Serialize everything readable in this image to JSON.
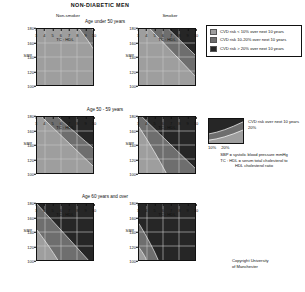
{
  "title": "NON-DIABETIC MEN",
  "columns": [
    {
      "id": "non-smoker",
      "label": "Non-smoker"
    },
    {
      "id": "smoker",
      "label": "Smoker"
    }
  ],
  "rows": [
    {
      "id": "age-under-50",
      "label": "Age under 50 years"
    },
    {
      "id": "age-50-59",
      "label": "Age 50 - 59 years"
    },
    {
      "id": "age-60-over",
      "label": "Age 60 years and over"
    }
  ],
  "axes": {
    "ylabel": "SBP",
    "xlabel": "TC : HDL",
    "yticks": [
      "180",
      "160",
      "140",
      "120",
      "100"
    ],
    "xticks": [
      "3",
      "4",
      "5",
      "6",
      "7",
      "8",
      "9",
      "10"
    ],
    "ylim": [
      100,
      180
    ],
    "xlim": [
      3,
      10
    ]
  },
  "legend": {
    "items": [
      {
        "color": "#9e9e9e",
        "label": "CVD risk < 10% over next 10 years"
      },
      {
        "color": "#6e6e6e",
        "label": "CVD risk 10-20% over next 10 years"
      },
      {
        "color": "#262626",
        "label": "CVD risk > 20% over next 10 years"
      }
    ]
  },
  "key": {
    "caption": "CVD risk over next 10 years",
    "caption_value": "20%",
    "percent_low": "10%",
    "percent_high": "20%"
  },
  "definitions": {
    "line1": "SBP = systolic blood pressure mmHg",
    "line2": "TC : HDL = serum total cholesterol to",
    "line3": "HDL cholesterol ratio"
  },
  "copyright": {
    "line1": "Copyright University",
    "line2": "of Manchester"
  },
  "colors": {
    "low": "#9e9e9e",
    "mid": "#6e6e6e",
    "high": "#262626",
    "grid": "#c9c9c9",
    "axis": "#111111"
  },
  "chart_data": {
    "type": "heatmap",
    "title": "NON-DIABETIC MEN",
    "xlabel": "TC : HDL",
    "ylabel": "SBP",
    "xlim": [
      3,
      10
    ],
    "ylim": [
      100,
      180
    ],
    "grid": true,
    "legend_position": "right",
    "zones": [
      "<10%",
      "10-20%",
      ">20%"
    ],
    "panels": [
      {
        "row": "Age under 50 years",
        "column": "Non-smoker",
        "boundary_10pct": [
          [
            8.3,
            180
          ],
          [
            10,
            152
          ]
        ],
        "boundary_20pct": [
          [
            9.9,
            180
          ],
          [
            10,
            176
          ]
        ],
        "dominant_zone": "<10%"
      },
      {
        "row": "Age under 50 years",
        "column": "Smoker",
        "boundary_10pct": [
          [
            4.4,
            180
          ],
          [
            10,
            113
          ]
        ],
        "boundary_20pct": [
          [
            6.7,
            180
          ],
          [
            10,
            143
          ]
        ],
        "dominant_zone": "10-20%"
      },
      {
        "row": "Age 50 - 59 years",
        "column": "Non-smoker",
        "boundary_10pct": [
          [
            3.6,
            180
          ],
          [
            10,
            110
          ]
        ],
        "boundary_20pct": [
          [
            5.6,
            180
          ],
          [
            10,
            136
          ]
        ],
        "dominant_zone": "10-20%"
      },
      {
        "row": "Age 50 - 59 years",
        "column": "Smoker",
        "boundary_10pct": [
          [
            3.0,
            166
          ],
          [
            6.4,
            100
          ]
        ],
        "boundary_20pct": [
          [
            3.4,
            180
          ],
          [
            10,
            107
          ]
        ],
        "dominant_zone": ">20%"
      },
      {
        "row": "Age 60 years and over",
        "column": "Non-smoker",
        "boundary_10pct": [
          [
            3.0,
            143
          ],
          [
            5.6,
            100
          ]
        ],
        "boundary_20pct": [
          [
            3.0,
            180
          ],
          [
            9.4,
            100
          ]
        ],
        "dominant_zone": ">20%"
      },
      {
        "row": "Age 60 years and over",
        "column": "Smoker",
        "boundary_10pct": [
          [
            3.0,
            118
          ],
          [
            3.9,
            100
          ]
        ],
        "boundary_20pct": [
          [
            3.0,
            152
          ],
          [
            5.4,
            100
          ]
        ],
        "dominant_zone": ">20%"
      }
    ]
  }
}
